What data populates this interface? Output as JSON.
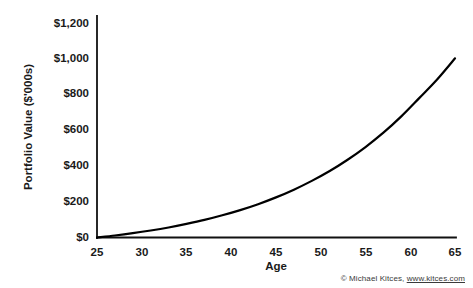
{
  "chart_data": {
    "type": "line",
    "title": "",
    "xlabel": "Age",
    "ylabel": "Portfolio Value ($'000s)",
    "xlim": [
      25,
      65
    ],
    "ylim": [
      0,
      1200
    ],
    "grid": false,
    "legend": "none",
    "xticks": [
      "25",
      "30",
      "35",
      "40",
      "45",
      "50",
      "55",
      "60",
      "65"
    ],
    "xtick_values": [
      25,
      30,
      35,
      40,
      45,
      50,
      55,
      60,
      65
    ],
    "yticks": [
      "$0",
      "$200",
      "$400",
      "$600",
      "$800",
      "$1,000",
      "$1,200"
    ],
    "ytick_values": [
      0,
      200,
      400,
      600,
      800,
      1000,
      1200
    ],
    "series": [
      {
        "name": "Portfolio Value",
        "color": "#000000",
        "x": [
          25,
          27,
          29,
          31,
          33,
          35,
          37,
          39,
          41,
          43,
          45,
          47,
          49,
          51,
          53,
          55,
          57,
          59,
          61,
          63,
          65
        ],
        "values": [
          0,
          11,
          24,
          39,
          56,
          76,
          98,
          124,
          153,
          186,
          224,
          267,
          316,
          371,
          434,
          505,
          585,
          676,
          778,
          882,
          1000
        ]
      }
    ]
  },
  "attribution": {
    "copyright": "© Michael Kitces,",
    "url": "www.kitces.com"
  },
  "colors": {
    "line": "#000000",
    "axis": "#111111",
    "background": "#ffffff",
    "text": "#1a1a1a"
  }
}
